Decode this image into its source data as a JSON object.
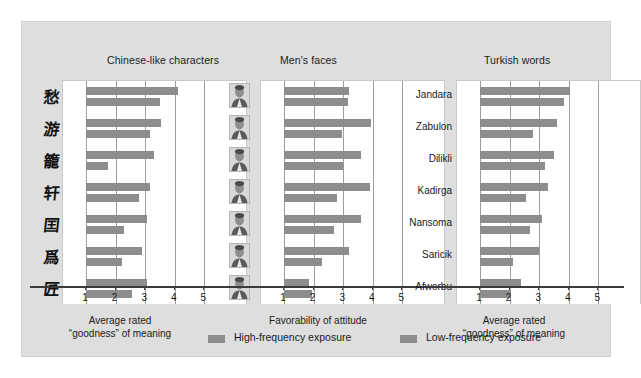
{
  "figure": {
    "background_color": "#dedede",
    "bar_color": "#8d8d8d",
    "legend": [
      {
        "label": "High-frequency exposure",
        "series": "high"
      },
      {
        "label": "Low-frequency exposure",
        "series": "low"
      }
    ]
  },
  "panels": [
    {
      "title": "Chinese-like characters",
      "xlabel": "Average rated\n“goodness” of meaning",
      "ticks": [
        "1",
        "2",
        "3",
        "4",
        "5"
      ],
      "categories": [
        "char-1",
        "char-2",
        "char-3",
        "char-4",
        "char-5",
        "char-6",
        "char-7"
      ],
      "category_glyphs": [
        "愁",
        "游",
        "籠",
        "轩",
        "囯",
        "爲",
        "匠"
      ],
      "high": [
        4.1,
        3.55,
        3.3,
        3.15,
        3.05,
        2.9,
        3.05
      ],
      "low": [
        3.5,
        3.15,
        1.75,
        2.8,
        2.3,
        2.2,
        2.55
      ]
    },
    {
      "title": "Men's faces",
      "xlabel": "Favorability of attitude",
      "ticks": [
        "1",
        "2",
        "3",
        "4",
        "5"
      ],
      "categories": [
        "face-1",
        "face-2",
        "face-3",
        "face-4",
        "face-5",
        "face-6",
        "face-7"
      ],
      "high": [
        3.2,
        3.95,
        3.6,
        3.9,
        3.6,
        3.2,
        1.85
      ],
      "low": [
        3.15,
        2.95,
        3.0,
        2.8,
        2.7,
        2.3,
        1.95
      ]
    },
    {
      "title": "Turkish words",
      "xlabel": "Average rated\n“goodness” of meaning",
      "ticks": [
        "1",
        "2",
        "3",
        "4",
        "5"
      ],
      "categories": [
        "Jandara",
        "Zabulon",
        "Dilikli",
        "Kadirga",
        "Nansoma",
        "Saricik",
        "Afworbu"
      ],
      "high": [
        4.05,
        3.6,
        3.5,
        3.3,
        3.1,
        3.0,
        2.4
      ],
      "low": [
        3.85,
        2.8,
        3.2,
        2.55,
        2.7,
        2.1,
        2.05
      ]
    }
  ],
  "chart_data": {
    "type": "bar",
    "title": "",
    "orientation": "horizontal",
    "grid": true,
    "legend_position": "bottom",
    "xlim": [
      1,
      5
    ],
    "series_names": [
      "High-frequency exposure",
      "Low-frequency exposure"
    ],
    "panels": [
      {
        "title": "Chinese-like characters",
        "xlabel": "Average rated “goodness” of meaning",
        "categories": [
          "char-1",
          "char-2",
          "char-3",
          "char-4",
          "char-5",
          "char-6",
          "char-7"
        ],
        "series": [
          {
            "name": "High-frequency exposure",
            "values": [
              4.1,
              3.55,
              3.3,
              3.15,
              3.05,
              2.9,
              3.05
            ]
          },
          {
            "name": "Low-frequency exposure",
            "values": [
              3.5,
              3.15,
              1.75,
              2.8,
              2.3,
              2.2,
              2.55
            ]
          }
        ]
      },
      {
        "title": "Men's faces",
        "xlabel": "Favorability of attitude",
        "categories": [
          "face-1",
          "face-2",
          "face-3",
          "face-4",
          "face-5",
          "face-6",
          "face-7"
        ],
        "series": [
          {
            "name": "High-frequency exposure",
            "values": [
              3.2,
              3.95,
              3.6,
              3.9,
              3.6,
              3.2,
              1.85
            ]
          },
          {
            "name": "Low-frequency exposure",
            "values": [
              3.15,
              2.95,
              3.0,
              2.8,
              2.7,
              2.3,
              1.95
            ]
          }
        ]
      },
      {
        "title": "Turkish words",
        "xlabel": "Average rated “goodness” of meaning",
        "categories": [
          "Jandara",
          "Zabulon",
          "Dilikli",
          "Kadirga",
          "Nansoma",
          "Saricik",
          "Afworbu"
        ],
        "series": [
          {
            "name": "High-frequency exposure",
            "values": [
              4.05,
              3.6,
              3.5,
              3.3,
              3.1,
              3.0,
              2.4
            ]
          },
          {
            "name": "Low-frequency exposure",
            "values": [
              3.85,
              2.8,
              3.2,
              2.55,
              2.7,
              2.1,
              2.05
            ]
          }
        ]
      }
    ]
  }
}
